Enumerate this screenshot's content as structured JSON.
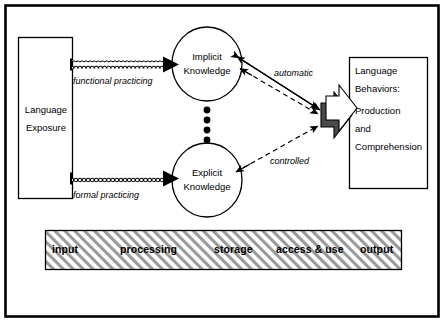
{
  "figure": {
    "type": "diagram",
    "title_visible": false,
    "background_color": "#ffffff",
    "line_color": "#000000",
    "hatch_color": "#8c8c8c"
  },
  "nodes": {
    "language_exposure": {
      "label_line1": "Language",
      "label_line2": "Exposure",
      "shape": "rectangle"
    },
    "implicit_knowledge": {
      "label_line1": "Implicit",
      "label_line2": "Knowledge",
      "shape": "ellipse"
    },
    "explicit_knowledge": {
      "label_line1": "Explicit",
      "label_line2": "Knowledge",
      "shape": "ellipse"
    },
    "language_behaviors": {
      "label_line1": "Language",
      "label_line2": "Behaviors:",
      "label_line3": "Production",
      "label_line4": "and",
      "label_line5": "Comprehension",
      "shape": "rectangle"
    }
  },
  "edges": {
    "functional_practicing": {
      "label": "functional practicing",
      "style": "chain-arrow",
      "from": "language_exposure",
      "to": "implicit_knowledge"
    },
    "formal_practicing": {
      "label": "formal practicing",
      "style": "chain-arrow",
      "from": "language_exposure",
      "to": "explicit_knowledge"
    },
    "automatic": {
      "label": "automatic",
      "style": "solid-and-dashed-double-arrow",
      "from": "implicit_knowledge",
      "to": "language_behaviors"
    },
    "controlled": {
      "label": "controlled",
      "style": "dashed-double-arrow",
      "from": "explicit_knowledge",
      "to": "language_behaviors"
    },
    "knowledge_link": {
      "label": "",
      "style": "dotted-beads",
      "from": "implicit_knowledge",
      "to": "explicit_knowledge"
    }
  },
  "process_bar": {
    "fill": "hatched-diagonal",
    "stages": [
      {
        "label": "input"
      },
      {
        "label": "processing"
      },
      {
        "label": "storage"
      },
      {
        "label": "access & use"
      },
      {
        "label": "output"
      }
    ]
  }
}
